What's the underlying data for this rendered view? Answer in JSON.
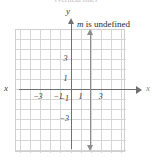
{
  "figure": {
    "caption": "(vertical line)",
    "annotation_symbol": "m",
    "annotation_text": " is undefined",
    "axes": {
      "x_label_left": "x",
      "x_label_right": "x",
      "y_label": "y"
    },
    "x_ticks": [
      {
        "value": -3,
        "label": "−3"
      },
      {
        "value": -1,
        "label": "−1"
      },
      {
        "value": 1,
        "label": "1"
      },
      {
        "value": 3,
        "label": "3"
      }
    ],
    "y_ticks": [
      {
        "value": 3,
        "label": "3"
      },
      {
        "value": 1,
        "label": "1"
      },
      {
        "value": -1,
        "label": "−1"
      },
      {
        "value": -3,
        "label": "−3"
      }
    ]
  },
  "chart_data": {
    "type": "line",
    "title": "(vertical line)",
    "xlabel": "x",
    "ylabel": "y",
    "xlim": [
      -5,
      6
    ],
    "ylim": [
      -5,
      6
    ],
    "grid": true,
    "grid_step": 1,
    "legend": "none",
    "annotations": [
      "m is undefined"
    ],
    "series": [
      {
        "name": "x = 1",
        "equation": "x = 1",
        "slope": "undefined",
        "points": [
          [
            1,
            -4.5
          ],
          [
            1,
            4.5
          ]
        ],
        "arrow_both_ends": true,
        "color": "#8d8d8d"
      }
    ],
    "xticks": [
      -3,
      -1,
      1,
      3
    ],
    "xticklabels": [
      "−3",
      "−1",
      "1",
      "3"
    ],
    "yticks": [
      -3,
      -1,
      1,
      3
    ],
    "yticklabels": [
      "−3",
      "−1",
      "1",
      "3"
    ]
  },
  "colors": {
    "grid": "#d6d6d6",
    "axis": "#707070",
    "line": "#8d8d8d",
    "text": "#2a2a2a",
    "caption": "#b9b9b9"
  }
}
